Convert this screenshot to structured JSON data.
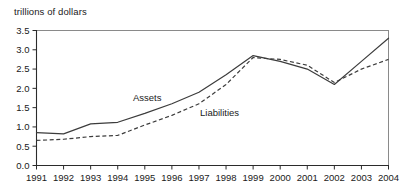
{
  "chart_data": {
    "type": "line",
    "title": "",
    "ylabel": "trillions of dollars",
    "xlabel": "",
    "categories": [
      "1991",
      "1992",
      "1993",
      "1994",
      "1995",
      "1996",
      "1997",
      "1998",
      "1999",
      "2000",
      "2001",
      "2002",
      "2003",
      "2004"
    ],
    "series": [
      {
        "name": "Assets",
        "style": "solid",
        "values": [
          0.85,
          0.82,
          1.08,
          1.12,
          1.35,
          1.6,
          1.9,
          2.35,
          2.85,
          2.7,
          2.5,
          2.1,
          2.7,
          3.3
        ]
      },
      {
        "name": "Liabilities",
        "style": "dashed",
        "values": [
          0.65,
          0.68,
          0.75,
          0.78,
          1.05,
          1.3,
          1.6,
          2.1,
          2.8,
          2.75,
          2.6,
          2.15,
          2.5,
          2.75
        ]
      }
    ],
    "ylim": [
      0.0,
      3.5
    ],
    "yticks": [
      "0.0",
      "0.5",
      "1.0",
      "1.5",
      "2.0",
      "2.5",
      "3.0",
      "3.5"
    ],
    "ytick_values": [
      0.0,
      0.5,
      1.0,
      1.5,
      2.0,
      2.5,
      3.0,
      3.5
    ],
    "xticks": [
      "1991",
      "1992",
      "1993",
      "1994",
      "1995",
      "1996",
      "1997",
      "1998",
      "1999",
      "2000",
      "2001",
      "2002",
      "2003",
      "2004"
    ],
    "grid": false,
    "legend": "inline-annotations",
    "annotations": [
      {
        "text": "Assets",
        "x_px": 133,
        "y_px": 101
      },
      {
        "text": "Liabilities",
        "x_px": 200,
        "y_px": 116
      }
    ],
    "colors": {
      "line": "#3c3c3c",
      "axis": "#2b2b2b",
      "frame": "#8a8a8a",
      "text": "#1a1a1a",
      "background": "#ffffff"
    }
  }
}
